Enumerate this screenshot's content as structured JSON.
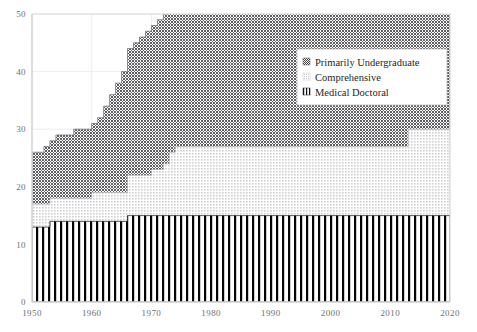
{
  "chart_data": {
    "type": "area",
    "title": "",
    "subtitle": "",
    "xlabel": "",
    "ylabel": "",
    "xlim": [
      1950,
      2020
    ],
    "ylim": [
      0,
      50
    ],
    "grid": true,
    "stacked": true,
    "step_style": "post",
    "legend_position": "inside-top-right",
    "x_tick_labels": [
      "1950",
      "1960",
      "1970",
      "1980",
      "1990",
      "2000",
      "2010",
      "2020"
    ],
    "x_ticks": [
      1950,
      1960,
      1970,
      1980,
      1990,
      2000,
      2010,
      2020
    ],
    "y_tick_labels": [
      "0",
      "10",
      "20",
      "30",
      "40",
      "50"
    ],
    "y_ticks": [
      0,
      10,
      20,
      30,
      40,
      50
    ],
    "x": [
      1950,
      1951,
      1952,
      1953,
      1954,
      1955,
      1956,
      1957,
      1958,
      1959,
      1960,
      1961,
      1962,
      1963,
      1964,
      1965,
      1966,
      1967,
      1968,
      1969,
      1970,
      1971,
      1972,
      1973,
      1974,
      1975,
      1976,
      1977,
      1978,
      1979,
      1980,
      1981,
      1982,
      1983,
      1984,
      1985,
      1986,
      1987,
      1988,
      1989,
      1990,
      1991,
      1992,
      1993,
      1994,
      1995,
      1996,
      1997,
      1998,
      1999,
      2000,
      2001,
      2002,
      2003,
      2004,
      2005,
      2006,
      2007,
      2008,
      2009,
      2010,
      2011,
      2012,
      2013,
      2014,
      2015,
      2016,
      2017,
      2018,
      2019,
      2020
    ],
    "series": [
      {
        "name": "Medical Doctoral",
        "pattern": "vertical-stripes",
        "color": "#000000",
        "values": [
          13,
          13,
          13,
          14,
          14,
          14,
          14,
          14,
          14,
          14,
          14,
          14,
          14,
          14,
          14,
          14,
          15,
          15,
          15,
          15,
          15,
          15,
          15,
          15,
          15,
          15,
          15,
          15,
          15,
          15,
          15,
          15,
          15,
          15,
          15,
          15,
          15,
          15,
          15,
          15,
          15,
          15,
          15,
          15,
          15,
          15,
          15,
          15,
          15,
          15,
          15,
          15,
          15,
          15,
          15,
          15,
          15,
          15,
          15,
          15,
          15,
          15,
          15,
          15,
          15,
          15,
          15,
          15,
          15,
          15,
          15
        ]
      },
      {
        "name": "Comprehensive",
        "pattern": "light-dots",
        "color": "#d7d7d9",
        "values": [
          4,
          4,
          4,
          4,
          4,
          4,
          4,
          4,
          4,
          4,
          5,
          5,
          5,
          5,
          5,
          5,
          7,
          7,
          7,
          7,
          8,
          8,
          9,
          11,
          12,
          12,
          12,
          12,
          12,
          12,
          12,
          12,
          12,
          12,
          12,
          12,
          12,
          12,
          12,
          12,
          12,
          12,
          12,
          12,
          12,
          12,
          12,
          12,
          12,
          12,
          12,
          12,
          12,
          12,
          12,
          12,
          12,
          12,
          12,
          12,
          12,
          12,
          12,
          15,
          15,
          15,
          15,
          15,
          15,
          15,
          15
        ]
      },
      {
        "name": "Primarily Undergraduate",
        "pattern": "dark-checks",
        "color": "#6e6e72",
        "values": [
          9,
          9,
          10,
          10,
          11,
          11,
          11,
          12,
          12,
          12,
          12,
          13,
          15,
          17,
          19,
          21,
          22,
          23,
          24,
          25,
          25,
          26,
          26,
          27,
          31,
          31,
          31,
          31,
          31,
          31,
          31,
          31,
          31,
          31,
          31,
          31,
          31,
          31,
          31,
          32,
          32,
          32,
          32,
          32,
          32,
          32,
          32,
          32,
          32,
          32,
          34,
          34,
          34,
          34,
          34,
          34,
          34,
          34,
          34,
          34,
          34,
          34,
          34,
          34,
          34,
          34,
          34,
          34,
          34,
          34,
          34
        ]
      }
    ],
    "totals": [
      26,
      26,
      27,
      28,
      29,
      29,
      29,
      30,
      30,
      30,
      31,
      32,
      34,
      36,
      38,
      40,
      44,
      45,
      46,
      47,
      48,
      49,
      50,
      53,
      58,
      58,
      58,
      58,
      58,
      58,
      58,
      58,
      58,
      58,
      58,
      58,
      58,
      58,
      58,
      59,
      59,
      59,
      59,
      59,
      59,
      59,
      59,
      59,
      59,
      59,
      61,
      61,
      61,
      61,
      61,
      61,
      61,
      61,
      61,
      61,
      61,
      61,
      61,
      64,
      64,
      64,
      64,
      64,
      64,
      64,
      64
    ]
  },
  "legend": {
    "items": [
      {
        "label": "Primarily Undergraduate",
        "swatch": "dark-checks-swatch"
      },
      {
        "label": "Comprehensive",
        "swatch": "light-dots-swatch"
      },
      {
        "label": "Medical Doctoral",
        "swatch": "vertical-stripes-swatch"
      }
    ]
  },
  "colors": {
    "undergraduate": "#6e6e72",
    "comprehensive": "#d7d7d9",
    "medical_doctoral": "#000000",
    "frame": "#d9d9dc",
    "gridline": "#e8e8ea",
    "tick_text": "#6f6f72"
  }
}
